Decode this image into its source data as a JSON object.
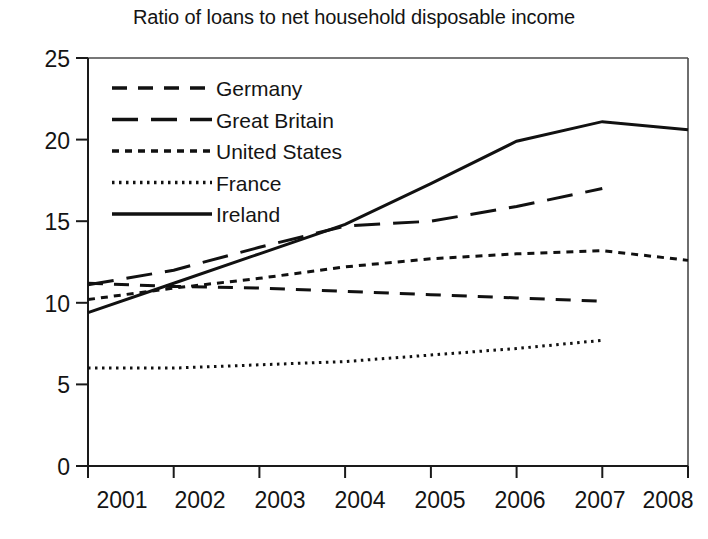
{
  "chart_data": {
    "type": "line",
    "title": "Ratio of loans to net household disposable income",
    "xlabel": "",
    "ylabel": "",
    "x": [
      2001,
      2002,
      2003,
      2004,
      2005,
      2006,
      2007,
      2008
    ],
    "categories": [
      "2001",
      "2002",
      "2003",
      "2004",
      "2005",
      "2006",
      "2007",
      "2008"
    ],
    "xlim": [
      2001,
      2008
    ],
    "ylim": [
      0,
      25
    ],
    "yticks": [
      0,
      5,
      10,
      15,
      20,
      25
    ],
    "ytick_labels": [
      "0",
      "5",
      "10",
      "15",
      "20",
      "25"
    ],
    "xtick_labels": [
      "2001",
      "2002",
      "2003",
      "2004",
      "2005",
      "2006",
      "2007",
      "2008"
    ],
    "grid": false,
    "legend_position": "upper-left-inside",
    "series": [
      {
        "name": "Germany",
        "dash": "dashed-medium",
        "x": [
          2001,
          2002,
          2003,
          2004,
          2005,
          2006,
          2007
        ],
        "values": [
          11.2,
          11.0,
          10.9,
          10.7,
          10.5,
          10.3,
          10.1
        ]
      },
      {
        "name": "Great Britain",
        "dash": "dashed-long",
        "x": [
          2001,
          2002,
          2003,
          2004,
          2005,
          2006,
          2007
        ],
        "values": [
          11.1,
          12.0,
          13.4,
          14.7,
          15.0,
          15.9,
          17.0
        ]
      },
      {
        "name": "United States",
        "dash": "dashed-short",
        "x": [
          2001,
          2002,
          2003,
          2004,
          2005,
          2006,
          2007,
          2008
        ],
        "values": [
          10.2,
          10.9,
          11.5,
          12.2,
          12.7,
          13.0,
          13.2,
          12.6
        ]
      },
      {
        "name": "France",
        "dash": "dotted",
        "x": [
          2001,
          2002,
          2003,
          2004,
          2005,
          2006,
          2007
        ],
        "values": [
          6.0,
          6.0,
          6.2,
          6.4,
          6.8,
          7.2,
          7.7
        ]
      },
      {
        "name": "Ireland",
        "dash": "solid",
        "x": [
          2001,
          2002,
          2003,
          2004,
          2005,
          2006,
          2007,
          2008
        ],
        "values": [
          9.4,
          11.2,
          13.0,
          14.8,
          17.3,
          19.9,
          21.1,
          20.6
        ]
      }
    ]
  },
  "legend": {
    "items": [
      {
        "label": "Germany"
      },
      {
        "label": "Great Britain"
      },
      {
        "label": "United States"
      },
      {
        "label": "France"
      },
      {
        "label": "Ireland"
      }
    ]
  },
  "axes": {
    "y_tick_labels": [
      "25",
      "20",
      "15",
      "10",
      "5",
      "0"
    ],
    "x_tick_labels": [
      "2001",
      "2002",
      "2003",
      "2004",
      "2005",
      "2006",
      "2007",
      "2008"
    ]
  }
}
